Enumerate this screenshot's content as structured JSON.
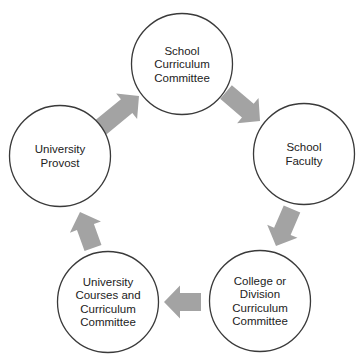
{
  "diagram": {
    "type": "cycle",
    "colors": {
      "circle_stroke": "#3a3a3a",
      "arrow_fill": "#a3a3a3",
      "text": "#222222",
      "background": "#ffffff"
    },
    "nodes": [
      {
        "id": "school-curriculum-committee",
        "lines": [
          "School",
          "Curriculum",
          "Committee"
        ]
      },
      {
        "id": "school-faculty",
        "lines": [
          "School",
          "Faculty"
        ]
      },
      {
        "id": "college-division-curriculum-committee",
        "lines": [
          "College or",
          "Division",
          "Curriculum",
          "Committee"
        ]
      },
      {
        "id": "university-courses-curriculum-committee",
        "lines": [
          "University",
          "Courses and",
          "Curriculum",
          "Committee"
        ]
      },
      {
        "id": "university-provost",
        "lines": [
          "University",
          "Provost"
        ]
      }
    ],
    "edges": [
      {
        "from": "school-curriculum-committee",
        "to": "school-faculty"
      },
      {
        "from": "school-faculty",
        "to": "college-division-curriculum-committee"
      },
      {
        "from": "college-division-curriculum-committee",
        "to": "university-courses-curriculum-committee"
      },
      {
        "from": "university-courses-curriculum-committee",
        "to": "university-provost"
      },
      {
        "from": "university-provost",
        "to": "school-curriculum-committee"
      }
    ]
  }
}
